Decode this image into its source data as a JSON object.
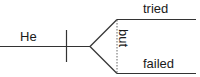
{
  "diagram": {
    "type": "sentence-diagram",
    "subject": "He",
    "conjunction": "but",
    "predicates": [
      "tried",
      "failed"
    ],
    "colors": {
      "line": "#333333",
      "text": "#1a1a1a",
      "background": "#ffffff"
    }
  }
}
